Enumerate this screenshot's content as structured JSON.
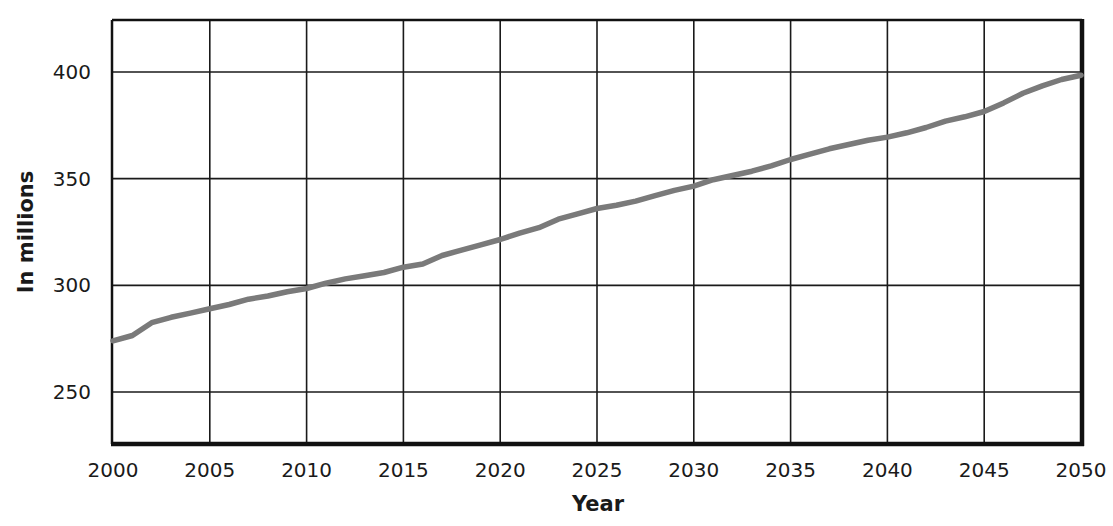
{
  "chart_data": {
    "type": "line",
    "title": "",
    "xlabel": "Year",
    "ylabel": "In millions",
    "xlim": [
      2000,
      2050
    ],
    "ylim": [
      225,
      425
    ],
    "grid": true,
    "legend": null,
    "x_ticks": [
      2000,
      2005,
      2010,
      2015,
      2020,
      2025,
      2030,
      2035,
      2040,
      2045,
      2050
    ],
    "y_ticks": [
      250,
      300,
      350,
      400
    ],
    "series": [
      {
        "name": "Population",
        "color": "#7a7a7a",
        "x": [
          2000,
          2001,
          2002,
          2003,
          2004,
          2005,
          2006,
          2007,
          2008,
          2009,
          2010,
          2011,
          2012,
          2013,
          2014,
          2015,
          2016,
          2017,
          2018,
          2019,
          2020,
          2021,
          2022,
          2023,
          2024,
          2025,
          2026,
          2027,
          2028,
          2029,
          2030,
          2031,
          2032,
          2033,
          2034,
          2035,
          2036,
          2037,
          2038,
          2039,
          2040,
          2041,
          2042,
          2043,
          2044,
          2045,
          2046,
          2047,
          2048,
          2049,
          2050
        ],
        "values": [
          274,
          276.5,
          282.5,
          285,
          287,
          289,
          291,
          293.5,
          295,
          297,
          298.5,
          301,
          303,
          304.5,
          306,
          308.5,
          310,
          314,
          316.5,
          319,
          321.5,
          324.5,
          327,
          331,
          333.5,
          336,
          337.5,
          339.5,
          342,
          344.5,
          346.5,
          349.5,
          351.5,
          353.5,
          356,
          359,
          361.5,
          364,
          366,
          368,
          369.5,
          371.5,
          374,
          377,
          379,
          381.5,
          385.5,
          390,
          393.5,
          396.5,
          398.5
        ]
      }
    ]
  },
  "axes": {
    "x_title": "Year",
    "y_title": "In millions",
    "x_tick_labels": [
      "2000",
      "2005",
      "2010",
      "2015",
      "2020",
      "2025",
      "2030",
      "2035",
      "2040",
      "2045",
      "2050"
    ],
    "y_tick_labels": [
      "400",
      "350",
      "300",
      "250"
    ]
  },
  "style": {
    "line_color": "#7a7a7a",
    "grid_color": "#1a1a1a",
    "frame_color": "#111111"
  }
}
